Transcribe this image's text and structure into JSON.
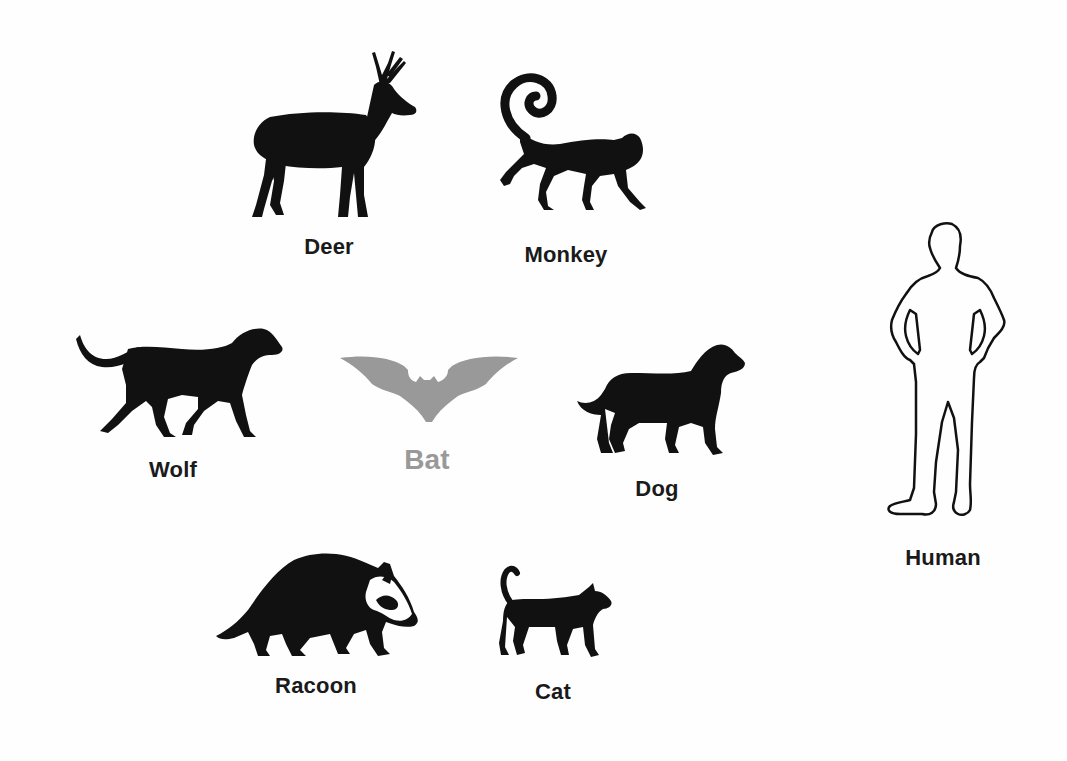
{
  "diagram": {
    "colors": {
      "background": "#fefefe",
      "silhouette": "#111111",
      "highlight": "#999999",
      "outline": "#111111"
    },
    "animals": {
      "deer": {
        "label": "Deer",
        "style": "silhouette"
      },
      "monkey": {
        "label": "Monkey",
        "style": "silhouette"
      },
      "wolf": {
        "label": "Wolf",
        "style": "silhouette"
      },
      "bat": {
        "label": "Bat",
        "style": "highlighted-gray"
      },
      "dog": {
        "label": "Dog",
        "style": "silhouette"
      },
      "racoon": {
        "label": "Racoon",
        "style": "silhouette"
      },
      "cat": {
        "label": "Cat",
        "style": "silhouette"
      },
      "human": {
        "label": "Human",
        "style": "outline"
      }
    }
  }
}
